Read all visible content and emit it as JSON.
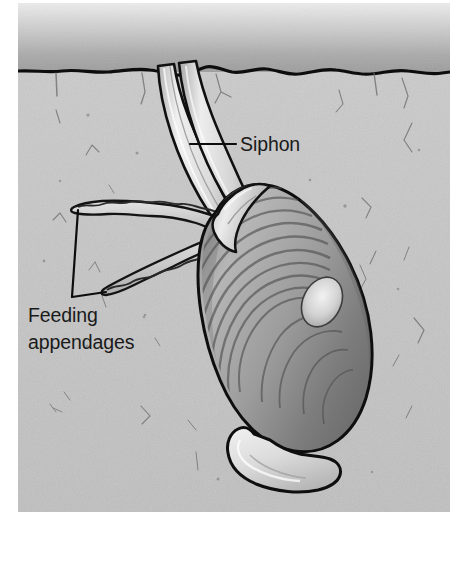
{
  "figure": {
    "type": "biological-illustration",
    "organism": "clam"
  },
  "labels": {
    "siphon": "Siphon",
    "feeding_line1": "Feeding",
    "feeding_line2": "appendages"
  },
  "regions": {
    "water_label": "water",
    "sediment_label": "sediment"
  },
  "parts": {
    "siphon_tubes": "siphon-tubes",
    "feeding_appendage_upper": "feeding-appendage-upper",
    "feeding_appendage_lower": "feeding-appendage-lower",
    "shell": "clam-shell",
    "foot": "clam-foot",
    "umbo": "shell-umbo"
  },
  "colors": {
    "page_background": "#ffffff",
    "water_top": "#e9e9e9",
    "water_bottom": "#9a9a9a",
    "sediment": "#c8c8c8",
    "sediment_dark": "#bdbdbd",
    "outline": "#111111",
    "shell_light": "#d8d8d8",
    "shell_mid": "#a9a9a9",
    "shell_dark": "#6e6e6e",
    "siphon_light": "#ededed",
    "siphon_shade": "#b0b0b0",
    "foot_light": "#e2e2e2",
    "label_text": "#1a1a1a"
  },
  "geometry": {
    "canvas_width": 459,
    "canvas_height": 576,
    "panel_left": 18,
    "panel_right": 450,
    "panel_top": 3,
    "panel_bottom": 512,
    "sediment_surface_y": 72,
    "siphon_label_x": 240,
    "siphon_label_y": 151,
    "siphon_leader_from_x": 190,
    "siphon_leader_to_x": 236,
    "siphon_leader_y": 144,
    "feeding_label_x": 28,
    "feeding_label_y1": 322,
    "feeding_label_y2": 349,
    "leader_apex_x": 72,
    "leader_apex_y": 297
  }
}
